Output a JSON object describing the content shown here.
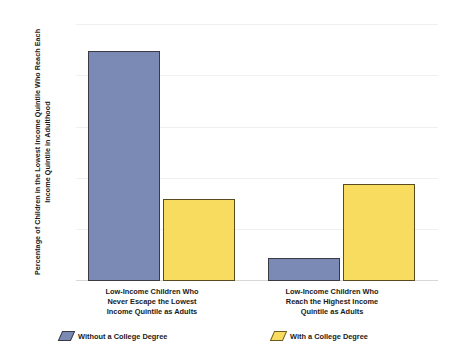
{
  "chart_data": {
    "type": "bar",
    "title": "",
    "xlabel": "",
    "ylabel": "Percentage of Children in the Lowest Income Quintile Who Reach Each Income Quintile in Adulthood",
    "ylim": [
      0,
      50
    ],
    "ytick_values": [
      50,
      40,
      30,
      20,
      10,
      0
    ],
    "ytick_labels": [
      "50",
      "40",
      "30",
      "20",
      "10",
      "0"
    ],
    "grid": true,
    "legend_position": "bottom",
    "categories": [
      "Low-Income Children Who Never Escape the Lowest Income Quintile as Adults",
      "Low-Income Children Who Reach the Highest Income Quintile as Adults"
    ],
    "category_lines": [
      [
        "Low-Income Children Who",
        "Never Escape the Lowest",
        "Income Quintile as Adults"
      ],
      [
        "Low-Income Children Who",
        "Reach the Highest Income",
        "Quintile as Adults"
      ]
    ],
    "series": [
      {
        "name": "Without a College Degree",
        "color": "#7b8ab5",
        "values": [
          45,
          4.5
        ]
      },
      {
        "name": "With a College Degree",
        "color": "#f8dc60",
        "values": [
          16,
          19
        ]
      }
    ]
  },
  "legend": {
    "items": [
      {
        "label": "Without a College Degree",
        "swatch": "blue"
      },
      {
        "label": "With a College Degree",
        "swatch": "yellow"
      }
    ]
  },
  "colors": {
    "series_without_degree": "#7b8ab5",
    "series_with_degree": "#f8dc60",
    "gridline": "#f0f0f0",
    "baseline": "#d8d8d8",
    "text": "#1a1a1a",
    "background": "#ffffff"
  }
}
